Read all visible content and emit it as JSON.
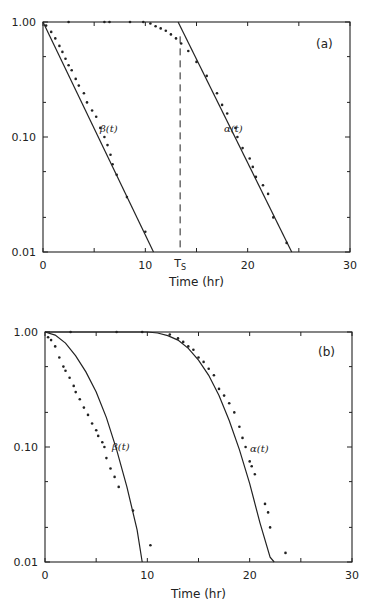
{
  "chart_data": [
    {
      "type": "scatter",
      "panel_label": "(a)",
      "xlabel": "Time (hr)",
      "ylabel": "",
      "xlim": [
        0,
        30
      ],
      "ylim": [
        0.01,
        1.0
      ],
      "yscale": "log",
      "x_tick_labels": [
        "0",
        "10",
        "20",
        "30"
      ],
      "y_tick_labels": [
        "1.00",
        "0.10",
        "0.01"
      ],
      "annotations": [
        {
          "text": "T",
          "sub": "S",
          "x": 13.4,
          "note": "vertical dashed line at Ts"
        }
      ],
      "series": [
        {
          "name": "β(t)",
          "label": "β(t)",
          "fit_line": [
            [
              0,
              1.0
            ],
            [
              10.8,
              0.01
            ]
          ],
          "points": [
            [
              0.3,
              0.93
            ],
            [
              0.8,
              0.82
            ],
            [
              1.2,
              0.72
            ],
            [
              1.6,
              0.62
            ],
            [
              1.9,
              0.55
            ],
            [
              2.2,
              0.48
            ],
            [
              2.5,
              0.42
            ],
            [
              2.8,
              0.38
            ],
            [
              3.2,
              0.32
            ],
            [
              3.5,
              0.28
            ],
            [
              4.0,
              0.24
            ],
            [
              4.3,
              0.2
            ],
            [
              4.8,
              0.17
            ],
            [
              5.2,
              0.15
            ],
            [
              5.6,
              0.12
            ],
            [
              6.0,
              0.1
            ],
            [
              6.3,
              0.085
            ],
            [
              6.6,
              0.07
            ],
            [
              6.8,
              0.058
            ],
            [
              7.2,
              0.047
            ],
            [
              8.2,
              0.03
            ],
            [
              10.0,
              0.015
            ]
          ]
        },
        {
          "name": "α(t)",
          "label": "α(t)",
          "fit_line": [
            [
              13.2,
              1.0
            ],
            [
              24.3,
              0.01
            ]
          ],
          "points": [
            [
              2.5,
              1.0
            ],
            [
              6.0,
              1.0
            ],
            [
              6.5,
              1.0
            ],
            [
              8.5,
              1.0
            ],
            [
              9.8,
              1.0
            ],
            [
              10.5,
              0.97
            ],
            [
              11.0,
              0.92
            ],
            [
              11.5,
              0.88
            ],
            [
              12.0,
              0.84
            ],
            [
              12.5,
              0.78
            ],
            [
              13.0,
              0.72
            ],
            [
              13.5,
              0.65
            ],
            [
              14.2,
              0.56
            ],
            [
              15.0,
              0.45
            ],
            [
              16.0,
              0.34
            ],
            [
              17.0,
              0.24
            ],
            [
              17.5,
              0.19
            ],
            [
              18.0,
              0.16
            ],
            [
              18.8,
              0.12
            ],
            [
              19.0,
              0.1
            ],
            [
              19.5,
              0.08
            ],
            [
              20.2,
              0.065
            ],
            [
              20.5,
              0.055
            ],
            [
              20.8,
              0.045
            ],
            [
              21.5,
              0.038
            ],
            [
              22.0,
              0.032
            ],
            [
              22.5,
              0.02
            ],
            [
              23.8,
              0.012
            ]
          ]
        }
      ]
    },
    {
      "type": "scatter",
      "panel_label": "(b)",
      "xlabel": "Time (hr)",
      "ylabel": "",
      "xlim": [
        0,
        30
      ],
      "ylim": [
        0.01,
        1.0
      ],
      "yscale": "log",
      "x_tick_labels": [
        "0",
        "10",
        "20",
        "30"
      ],
      "y_tick_labels": [
        "1.00",
        "0.10",
        "0.01"
      ],
      "series": [
        {
          "name": "β(t)",
          "label": "β(t)",
          "fit_curve": [
            [
              0,
              1.0
            ],
            [
              1,
              0.94
            ],
            [
              2,
              0.8
            ],
            [
              3,
              0.62
            ],
            [
              4,
              0.45
            ],
            [
              5,
              0.3
            ],
            [
              6,
              0.18
            ],
            [
              7,
              0.095
            ],
            [
              8,
              0.045
            ],
            [
              9,
              0.019
            ],
            [
              9.5,
              0.01
            ]
          ],
          "points": [
            [
              0.3,
              0.9
            ],
            [
              0.6,
              0.85
            ],
            [
              1.0,
              0.75
            ],
            [
              1.4,
              0.6
            ],
            [
              1.8,
              0.5
            ],
            [
              2.0,
              0.46
            ],
            [
              2.4,
              0.4
            ],
            [
              2.8,
              0.34
            ],
            [
              3.0,
              0.3
            ],
            [
              3.4,
              0.26
            ],
            [
              3.8,
              0.22
            ],
            [
              4.2,
              0.19
            ],
            [
              4.6,
              0.16
            ],
            [
              5.0,
              0.14
            ],
            [
              5.2,
              0.125
            ],
            [
              5.6,
              0.11
            ],
            [
              5.8,
              0.1
            ],
            [
              6.0,
              0.08
            ],
            [
              6.4,
              0.065
            ],
            [
              6.8,
              0.055
            ],
            [
              7.2,
              0.045
            ],
            [
              8.6,
              0.028
            ],
            [
              10.3,
              0.014
            ]
          ]
        },
        {
          "name": "α(t)",
          "label": "α(t)",
          "fit_curve": [
            [
              0,
              1.0
            ],
            [
              10,
              1.0
            ],
            [
              11,
              0.98
            ],
            [
              12,
              0.93
            ],
            [
              13,
              0.85
            ],
            [
              14,
              0.72
            ],
            [
              15,
              0.57
            ],
            [
              16,
              0.42
            ],
            [
              17,
              0.28
            ],
            [
              18,
              0.17
            ],
            [
              19,
              0.095
            ],
            [
              20,
              0.048
            ],
            [
              21,
              0.022
            ],
            [
              22,
              0.011
            ],
            [
              22.4,
              0.01
            ]
          ],
          "points": [
            [
              2.5,
              1.0
            ],
            [
              7.0,
              1.0
            ],
            [
              9.5,
              1.0
            ],
            [
              12.2,
              0.95
            ],
            [
              13.0,
              0.88
            ],
            [
              13.5,
              0.82
            ],
            [
              14.0,
              0.75
            ],
            [
              14.5,
              0.7
            ],
            [
              15.0,
              0.6
            ],
            [
              15.5,
              0.55
            ],
            [
              16.0,
              0.48
            ],
            [
              16.5,
              0.42
            ],
            [
              17.0,
              0.32
            ],
            [
              17.5,
              0.28
            ],
            [
              18.0,
              0.24
            ],
            [
              18.5,
              0.2
            ],
            [
              19.0,
              0.15
            ],
            [
              19.3,
              0.12
            ],
            [
              19.6,
              0.1
            ],
            [
              20.0,
              0.075
            ],
            [
              20.2,
              0.068
            ],
            [
              20.5,
              0.058
            ],
            [
              21.5,
              0.032
            ],
            [
              21.8,
              0.027
            ],
            [
              22.0,
              0.02
            ],
            [
              23.5,
              0.012
            ]
          ]
        }
      ]
    }
  ]
}
